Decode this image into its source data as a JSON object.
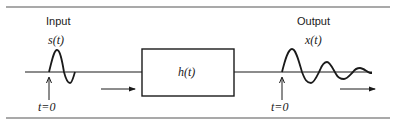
{
  "diagram": {
    "type": "linear system block diagram",
    "input": {
      "title": "Input",
      "signal_label": "s(t)",
      "time_marker": "t=0"
    },
    "system": {
      "label": "h(t)"
    },
    "output": {
      "title": "Output",
      "signal_label": "x(t)",
      "time_marker": "t=0"
    },
    "colors": {
      "line": "#1a1a1a",
      "rule": "#555555",
      "background": "#ffffff"
    }
  }
}
